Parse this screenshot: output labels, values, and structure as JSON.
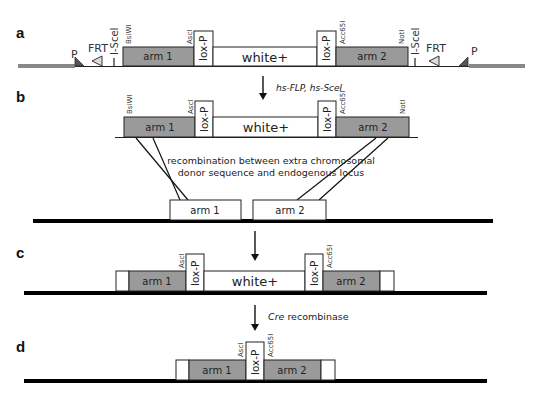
{
  "panels": {
    "a": {
      "label": "a",
      "promoter_left": "P",
      "frt_left": "FRT",
      "isce_left": "I-SceI",
      "site_bsiwi": "BsiWI",
      "arm1": "arm 1",
      "site_asci": "AscI",
      "loxp_left": "lox-P",
      "white": "white+",
      "loxp_right": "lox-P",
      "site_acc65i": "Acc65I",
      "arm2": "arm 2",
      "site_noti": "NotI",
      "isce_right": "I-SceI",
      "frt_right": "FRT",
      "promoter_right": "P"
    },
    "step_ab": {
      "label_part1": "hs-FLP, hs-SceI"
    },
    "b": {
      "label": "b",
      "site_bsiwi": "BsiWI",
      "arm1": "arm 1",
      "site_asci": "AscI",
      "loxp_left": "lox-P",
      "white": "white+",
      "loxp_right": "lox-P",
      "site_acc65i": "Acc65I",
      "arm2": "arm 2",
      "site_noti": "NotI",
      "note_line1": "recombination between extra chromosomal",
      "note_line2": "donor sequence and endogenous locus",
      "locus_arm1": "arm 1",
      "locus_arm2": "arm 2"
    },
    "c": {
      "label": "c",
      "arm1": "arm 1",
      "site_asci": "AscI",
      "loxp_left": "lox-P",
      "white": "white+",
      "loxp_right": "lox-P",
      "site_acc65i": "Acc65I",
      "arm2": "arm 2"
    },
    "step_cd": {
      "label_italic": "Cre",
      "label_rest": " recombinase"
    },
    "d": {
      "label": "d",
      "arm1": "arm 1",
      "site_asci": "AscI",
      "loxp": "lox-P",
      "site_acc65i": "Acc65I",
      "arm2": "arm 2"
    }
  },
  "colors": {
    "arm_fill": "#9a9a9a",
    "box_stroke": "#222222",
    "chromosome": "#000000",
    "donor_line": "#777777"
  }
}
